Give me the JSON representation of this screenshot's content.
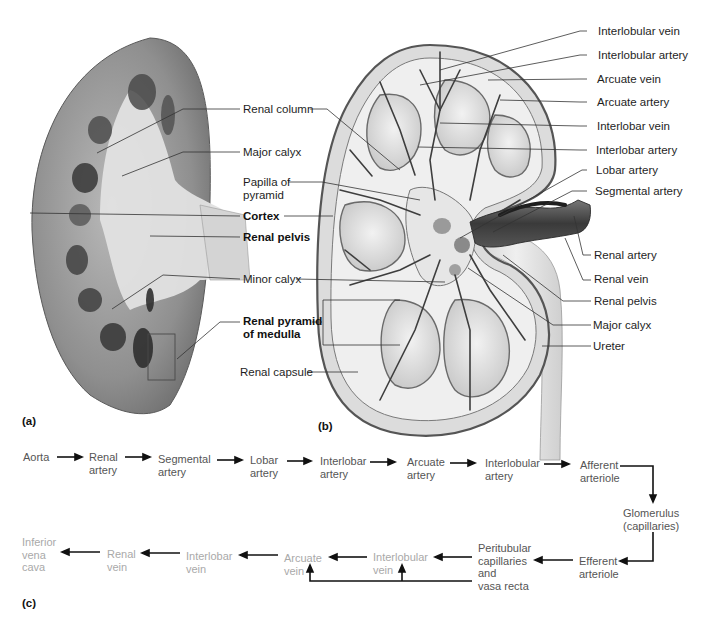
{
  "figure": {
    "panel_labels": {
      "a": "(a)",
      "b": "(b)",
      "c": "(c)"
    },
    "colors": {
      "artery_text": "#555555",
      "vein_text": "#a9a9a9",
      "label_text": "#1e1e1e",
      "leader_line": "#333333",
      "background": "#ffffff"
    }
  },
  "center_labels": [
    {
      "id": "renal-column",
      "text": "Renal column",
      "bold": false
    },
    {
      "id": "major-calyx-left",
      "text": "Major calyx",
      "bold": false
    },
    {
      "id": "papilla-of-pyramid",
      "text": "Papilla of\npyramid",
      "line1": "Papilla of",
      "line2": "pyramid",
      "bold": false
    },
    {
      "id": "cortex",
      "text": "Cortex",
      "bold": true
    },
    {
      "id": "renal-pelvis-left",
      "text": "Renal pelvis",
      "bold": true
    },
    {
      "id": "minor-calyx",
      "text": "Minor calyx",
      "bold": false
    },
    {
      "id": "renal-pyramid",
      "line1": "Renal pyramid",
      "line2": "of medulla",
      "bold": true
    },
    {
      "id": "renal-capsule",
      "text": "Renal capsule",
      "bold": false
    }
  ],
  "right_labels": [
    {
      "id": "interlobular-vein",
      "text": "Interlobular vein"
    },
    {
      "id": "interlobular-artery",
      "text": "Interlobular artery"
    },
    {
      "id": "arcuate-vein",
      "text": "Arcuate vein"
    },
    {
      "id": "arcuate-artery",
      "text": "Arcuate artery"
    },
    {
      "id": "interlobar-vein",
      "text": "Interlobar vein"
    },
    {
      "id": "interlobar-artery",
      "text": "Interlobar artery"
    },
    {
      "id": "lobar-artery",
      "text": "Lobar artery"
    },
    {
      "id": "segmental-artery",
      "text": "Segmental artery"
    },
    {
      "id": "renal-artery",
      "text": "Renal artery"
    },
    {
      "id": "renal-vein",
      "text": "Renal vein"
    },
    {
      "id": "renal-pelvis-right",
      "text": "Renal pelvis"
    },
    {
      "id": "major-calyx-right",
      "text": "Major calyx"
    },
    {
      "id": "ureter",
      "text": "Ureter"
    }
  ],
  "flowchart": {
    "arterial_row": [
      {
        "id": "aorta",
        "text": "Aorta"
      },
      {
        "id": "renal-artery",
        "text": "Renal\nartery"
      },
      {
        "id": "segmental-artery",
        "text": "Segmental\nartery"
      },
      {
        "id": "lobar-artery",
        "text": "Lobar\nartery"
      },
      {
        "id": "interlobar-artery",
        "text": "Interlobar\nartery"
      },
      {
        "id": "arcuate-artery",
        "text": "Arcuate\nartery"
      },
      {
        "id": "interlobular-artery",
        "text": "Interlobular\nartery"
      },
      {
        "id": "afferent-arteriole",
        "text": "Afferent\narteriole"
      }
    ],
    "capillary_nodes": [
      {
        "id": "glomerulus",
        "text": "Glomerulus\n(capillaries)"
      },
      {
        "id": "efferent-arteriole",
        "text": "Efferent\narteriole"
      },
      {
        "id": "peritubular",
        "text": "Peritubular\ncapillaries\nand\nvasa recta"
      }
    ],
    "venous_row": [
      {
        "id": "interlobular-vein",
        "text": "Interlobular\nvein"
      },
      {
        "id": "arcuate-vein",
        "text": "Arcuate\nvein"
      },
      {
        "id": "interlobar-vein",
        "text": "Interlobar\nvein"
      },
      {
        "id": "renal-vein",
        "text": "Renal\nvein"
      },
      {
        "id": "inferior-vena-cava",
        "text": "Inferior\nvena\ncava"
      }
    ]
  }
}
